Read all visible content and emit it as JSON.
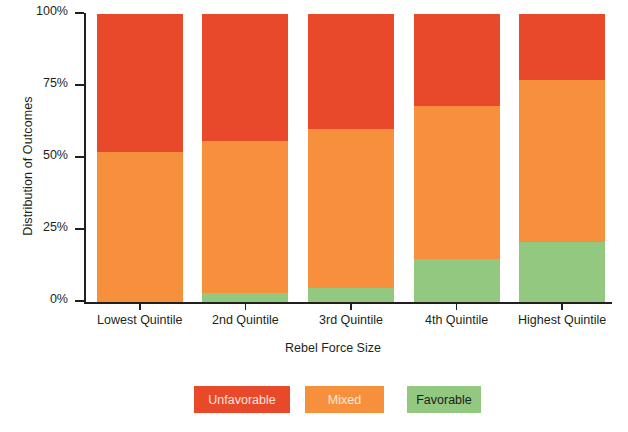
{
  "chart_data": {
    "type": "bar",
    "subtype": "stacked-percent",
    "title": "",
    "xlabel": "Rebel Force Size",
    "ylabel": "Distribution of Outcomes",
    "categories": [
      "Lowest Quintile",
      "2nd Quintile",
      "3rd Quintile",
      "4th Quintile",
      "Highest Quintile"
    ],
    "ylim": [
      0,
      100
    ],
    "ytick_labels": [
      "0%",
      "25%",
      "50%",
      "75%",
      "100%"
    ],
    "ytick_values": [
      0,
      25,
      50,
      75,
      100
    ],
    "grid": false,
    "legend_position": "bottom",
    "stack_order_bottom_to_top": [
      "Favorable",
      "Mixed",
      "Unfavorable"
    ],
    "series": [
      {
        "name": "Unfavorable",
        "color": "#e8492b",
        "values": [
          48,
          44,
          40,
          32,
          23
        ]
      },
      {
        "name": "Mixed",
        "color": "#f6903d",
        "values": [
          52,
          53,
          55,
          53,
          56
        ]
      },
      {
        "name": "Favorable",
        "color": "#93c881",
        "values": [
          0,
          3,
          5,
          15,
          21
        ]
      }
    ],
    "cumulative_tops": {
      "Favorable": [
        0,
        3,
        5,
        15,
        21
      ],
      "Mixed": [
        52,
        56,
        60,
        68,
        77
      ],
      "Unfavorable": [
        100,
        100,
        100,
        100,
        100
      ]
    },
    "footnote": ""
  },
  "legend": {
    "items": [
      {
        "label": "Unfavorable",
        "color": "#e8492b",
        "text_color": "#fbe3dc"
      },
      {
        "label": "Mixed",
        "color": "#f6903d",
        "text_color": "#fdeadb"
      },
      {
        "label": "Favorable",
        "color": "#93c881",
        "text_color": "#1d1d1b"
      }
    ]
  },
  "axis": {
    "y_title": "Distribution of Outcomes",
    "x_title": "Rebel Force Size"
  },
  "colors": {
    "unfavorable": "#e8492b",
    "mixed": "#f6903d",
    "favorable": "#93c881",
    "axis": "#231f20",
    "background": "#ffffff"
  }
}
